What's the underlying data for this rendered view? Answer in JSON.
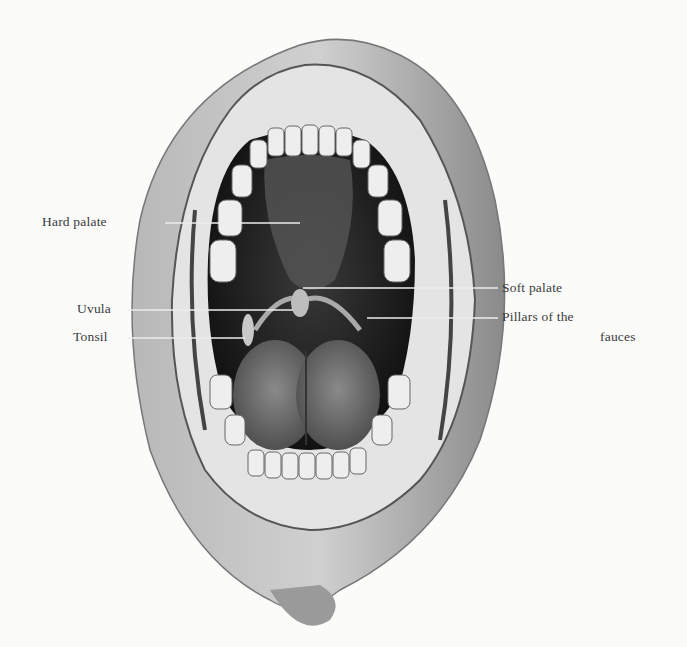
{
  "figure": {
    "style": "grayscale engraving",
    "colors": {
      "background": "#fbfbfa",
      "ink": "#2a2a2a",
      "label_text": "#3a3a3a",
      "leader_line": "#e8e8e8"
    }
  },
  "labels": {
    "hard_palate": "Hard palate",
    "uvula": "Uvula",
    "tonsil": "Tonsil",
    "soft_palate": "Soft palate",
    "pillars_line1": "Pillars of the",
    "pillars_line2": "fauces"
  }
}
